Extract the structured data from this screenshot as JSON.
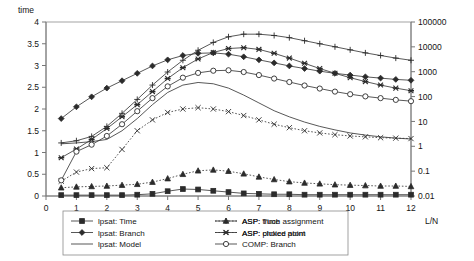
{
  "chart_data": {
    "type": "line",
    "title": "",
    "ylabel": "time",
    "xlabel": "L/N",
    "xlim": [
      0,
      12
    ],
    "xticks": [
      "0",
      "1",
      "2",
      "3",
      "4",
      "5",
      "6",
      "7",
      "8",
      "9",
      "10",
      "11",
      "12"
    ],
    "left_axis": {
      "label": "time",
      "scale": "linear",
      "ticks": [
        "0",
        "0.5",
        "1",
        "1.5",
        "2",
        "2.5",
        "3",
        "3.5",
        "4"
      ],
      "min": 0,
      "max": 4
    },
    "right_axis": {
      "label": "",
      "scale": "log",
      "ticks": [
        "0.01",
        "0.1",
        "1",
        "10",
        "100",
        "1000",
        "10000",
        "100000"
      ],
      "min": 0.01,
      "max": 100000
    },
    "grid": false,
    "legend_position": "bottom",
    "x": [
      0.5,
      1,
      1.5,
      2,
      2.5,
      3,
      3.5,
      4,
      4.5,
      5,
      5.5,
      6,
      6.5,
      7,
      7.5,
      8,
      8.5,
      9,
      9.5,
      10,
      10.5,
      11,
      11.5,
      12
    ],
    "series": [
      {
        "name": "lpsat: Time",
        "marker": "square-filled",
        "line": "solid",
        "values": [
          0.02,
          0.02,
          0.02,
          0.02,
          0.02,
          0.03,
          0.05,
          0.11,
          0.16,
          0.15,
          0.12,
          0.09,
          0.06,
          0.05,
          0.04,
          0.04,
          0.03,
          0.03,
          0.03,
          0.03,
          0.03,
          0.03,
          0.03,
          0.03
        ]
      },
      {
        "name": "lpsat: Branch",
        "marker": "diamond-filled",
        "line": "solid",
        "values": [
          1.78,
          2.05,
          2.28,
          2.48,
          2.65,
          2.82,
          2.99,
          3.13,
          3.23,
          3.28,
          3.29,
          3.26,
          3.2,
          3.13,
          3.06,
          2.99,
          2.93,
          2.87,
          2.82,
          2.78,
          2.74,
          2.71,
          2.68,
          2.66
        ]
      },
      {
        "name": "lpsat: Model",
        "marker": "none",
        "line": "solid",
        "values": [
          1.2,
          1.22,
          1.25,
          1.3,
          1.5,
          1.78,
          2.1,
          2.38,
          2.55,
          2.61,
          2.58,
          2.48,
          2.32,
          2.14,
          1.96,
          1.82,
          1.7,
          1.6,
          1.52,
          1.45,
          1.4,
          1.36,
          1.33,
          1.31
        ]
      },
      {
        "name": "ASP: Time",
        "marker": "triangle-filled",
        "line": "dotted",
        "values": [
          0.19,
          0.21,
          0.22,
          0.23,
          0.25,
          0.27,
          0.32,
          0.4,
          0.5,
          0.58,
          0.6,
          0.57,
          0.51,
          0.44,
          0.38,
          0.33,
          0.3,
          0.28,
          0.26,
          0.25,
          0.24,
          0.23,
          0.23,
          0.22
        ]
      },
      {
        "name": "ASP: picked atom",
        "marker": "star-filled",
        "line": "solid",
        "values": [
          0.88,
          1.08,
          1.3,
          1.55,
          1.82,
          2.1,
          2.4,
          2.7,
          2.95,
          3.15,
          3.3,
          3.39,
          3.41,
          3.37,
          3.28,
          3.17,
          3.05,
          2.93,
          2.82,
          2.72,
          2.63,
          2.55,
          2.48,
          2.42
        ]
      },
      {
        "name": "ASP: truch assignment",
        "marker": "plus",
        "line": "solid",
        "values": [
          1.22,
          1.27,
          1.37,
          1.6,
          1.9,
          2.22,
          2.55,
          2.85,
          3.12,
          3.35,
          3.53,
          3.66,
          3.72,
          3.72,
          3.69,
          3.64,
          3.57,
          3.5,
          3.43,
          3.36,
          3.29,
          3.23,
          3.17,
          3.12
        ]
      },
      {
        "name": "ASP: choice point",
        "marker": "cross",
        "line": "dotted",
        "values": [
          0.34,
          0.55,
          0.63,
          0.65,
          1.07,
          1.5,
          1.75,
          1.92,
          2.0,
          2.03,
          2.0,
          1.94,
          1.85,
          1.75,
          1.65,
          1.57,
          1.5,
          1.45,
          1.41,
          1.38,
          1.36,
          1.34,
          1.33,
          1.32
        ]
      },
      {
        "name": "COMP: Branch",
        "marker": "circle-open",
        "line": "solid",
        "values": [
          0.36,
          1.02,
          1.18,
          1.38,
          1.65,
          1.95,
          2.25,
          2.52,
          2.72,
          2.83,
          2.88,
          2.89,
          2.85,
          2.78,
          2.7,
          2.62,
          2.54,
          2.47,
          2.4,
          2.34,
          2.29,
          2.25,
          2.21,
          2.18
        ]
      }
    ],
    "legend": [
      {
        "label": "lpsat: Time",
        "marker": "square-filled",
        "line": "solid"
      },
      {
        "label": "lpsat: Branch",
        "marker": "diamond-filled",
        "line": "solid"
      },
      {
        "label": "lpsat: Model",
        "marker": "none",
        "line": "solid"
      },
      {
        "label": "ASP: Time",
        "marker": "triangle-filled",
        "line": "dotted"
      },
      {
        "label": "ASP: picked atom",
        "marker": "star-filled",
        "line": "solid"
      },
      {
        "label": "COMP: Branch",
        "marker": "circle-open",
        "line": "solid"
      },
      {
        "label": "ASP: truch assignment",
        "marker": "plus",
        "line": "solid"
      },
      {
        "label": "ASP: choice point",
        "marker": "cross",
        "line": "dotted"
      }
    ]
  }
}
